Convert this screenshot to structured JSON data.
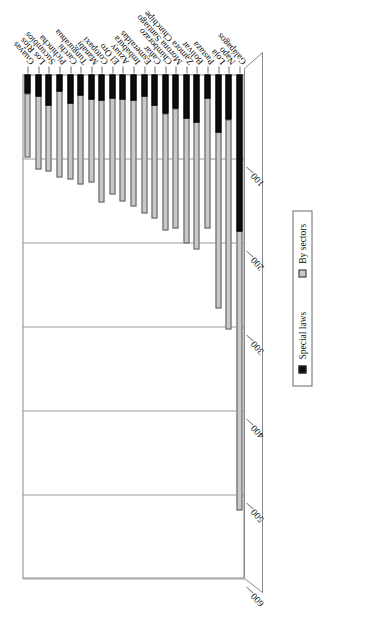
{
  "chart_data": {
    "type": "bar",
    "orientation": "horizontal-rotated",
    "title": "",
    "xlabel": "",
    "ylabel": "",
    "ylim": [
      0,
      600
    ],
    "yticks": [
      600,
      500,
      400,
      300,
      200,
      100
    ],
    "grid": true,
    "legend_position": "right",
    "stacked": true,
    "categories": [
      "Guayas",
      "Los Ríos",
      "Sucumbíos",
      "Pichincha",
      "Carchi",
      "Tungurahua",
      "Manabí",
      "Cotopaxi",
      "El Oro",
      "Azuay",
      "Imbabura",
      "Esmeraldas",
      "Cañar",
      "Chimborazo",
      "Morona Santiago",
      "Zamora Chinchipe",
      "Bolívar",
      "Pastaza",
      "Loja",
      "Napo",
      "Galápagos"
    ],
    "series": [
      {
        "name": "By sectors",
        "color": "#c8c8c8",
        "values": [
          77,
          88,
          80,
          103,
          92,
          107,
          100,
          122,
          116,
          122,
          127,
          140,
          135,
          140,
          143,
          150,
          152,
          156,
          210,
          250,
          333
        ]
      },
      {
        "name": "Special laws",
        "color": "#0d0d0d",
        "values": [
          23,
          26,
          37,
          20,
          34,
          25,
          30,
          31,
          28,
          30,
          31,
          26,
          37,
          47,
          41,
          52,
          57,
          28,
          69,
          54,
          187
        ]
      }
    ],
    "totals": [
      100,
      114,
      117,
      123,
      126,
      132,
      130,
      153,
      144,
      152,
      158,
      166,
      172,
      187,
      184,
      202,
      209,
      184,
      279,
      304,
      520
    ]
  },
  "legend": {
    "items": [
      {
        "label": "Special laws",
        "color": "#0d0d0d",
        "swatch_name": "legend-swatch-special-laws"
      },
      {
        "label": "By sectors",
        "color": "#c8c8c8",
        "swatch_name": "legend-swatch-by-sectors"
      }
    ]
  },
  "axis": {
    "value_ticks": [
      "600",
      "500",
      "400",
      "300",
      "200",
      "100"
    ],
    "value_max": 600
  }
}
